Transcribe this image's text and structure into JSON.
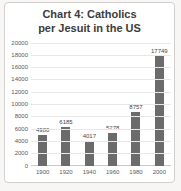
{
  "chart_data": {
    "type": "bar",
    "title": "Chart 4: Catholics per Jesuit in the US",
    "title_lines": [
      "Chart 4: Catholics",
      "per Jesuit in the US"
    ],
    "categories": [
      "1900",
      "1920",
      "1940",
      "1960",
      "1980",
      "2000"
    ],
    "values": [
      4980,
      6185,
      4017,
      5278,
      8757,
      17749
    ],
    "xlabel": "",
    "ylabel": "",
    "ylim": [
      0,
      20000
    ],
    "ytick_step": 2000,
    "grid": true,
    "legend_position": "none",
    "colors": {
      "bar": "#6b6b6b",
      "title": "#3b3b3b",
      "tick_label": "#595959",
      "value_label": "#454545",
      "gridline": "#e8e8e8",
      "axis_line": "#c9c9c9",
      "frame_border": "#d2d0ce",
      "chart_background": "#ffffff",
      "page_background": "#f8f6f4"
    }
  }
}
